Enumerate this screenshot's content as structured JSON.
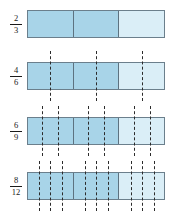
{
  "colors": {
    "shaded": "#a8d4e8",
    "unshaded": "#daeef7",
    "border": "#6b7f8c",
    "divider": "#5d7280",
    "dash": "#2b2b2b",
    "text": "#1a1a1a",
    "background": "#ffffff"
  },
  "layout": {
    "bar_left": 27,
    "bar_width": 138,
    "bar_height": 28,
    "label_left": 5,
    "label_width": 22
  },
  "rows": [
    {
      "id": "row-2-3",
      "numerator": "2",
      "denominator": "3",
      "top": 10,
      "total_parts": 3,
      "shaded_parts": 2,
      "dash_count": 0,
      "dash_overhang": 0,
      "cells": [
        "shaded",
        "shaded",
        "unshaded"
      ]
    },
    {
      "id": "row-4-6",
      "numerator": "4",
      "denominator": "6",
      "top": 62,
      "total_parts": 6,
      "shaded_parts": 4,
      "dash_count": 3,
      "dash_overhang": 11,
      "cells": [
        "shaded",
        "shaded",
        "unshaded"
      ]
    },
    {
      "id": "row-6-9",
      "numerator": "6",
      "denominator": "9",
      "top": 117,
      "total_parts": 9,
      "shaded_parts": 6,
      "dash_count": 6,
      "dash_overhang": 11,
      "cells": [
        "shaded",
        "shaded",
        "unshaded"
      ]
    },
    {
      "id": "row-8-12",
      "numerator": "8",
      "denominator": "12",
      "top": 172,
      "total_parts": 12,
      "shaded_parts": 8,
      "dash_count": 9,
      "dash_overhang": 11,
      "cells": [
        "shaded",
        "shaded",
        "unshaded"
      ]
    }
  ]
}
